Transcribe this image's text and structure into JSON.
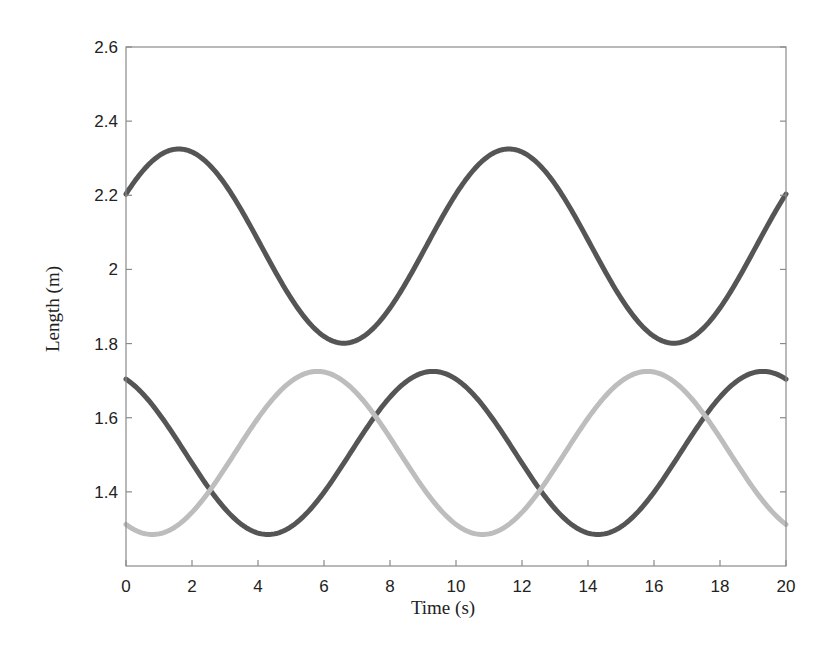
{
  "chart_data": {
    "type": "line",
    "title": "",
    "xlabel": "Time (s)",
    "ylabel": "Length (m)",
    "xlim": [
      0,
      20
    ],
    "ylim": [
      1.2,
      2.6
    ],
    "grid": false,
    "legend": null,
    "xticks": [
      0,
      2,
      4,
      6,
      8,
      10,
      12,
      14,
      16,
      18,
      20
    ],
    "xtick_labels": [
      "0",
      "2",
      "4",
      "6",
      "8",
      "10",
      "12",
      "14",
      "16",
      "18",
      "20"
    ],
    "yticks": [
      1.4,
      1.6,
      1.8,
      2.0,
      2.2,
      2.4,
      2.6
    ],
    "ytick_labels": [
      "1.4",
      "1.6",
      "1.8",
      "2",
      "2.2",
      "2.4",
      "2.6"
    ],
    "x": [
      0,
      1,
      2,
      3,
      4,
      5,
      6,
      7,
      8,
      9,
      10,
      11,
      12,
      13,
      14,
      15,
      16,
      17,
      18,
      19,
      20
    ],
    "series": [
      {
        "name": "upper (dark)",
        "color": "#555555",
        "model": {
          "center": 2.063,
          "amplitude": 0.262,
          "period": 10,
          "phase_peak_t": 1.6
        },
        "values": [
          2.21,
          2.31,
          2.32,
          2.23,
          2.08,
          1.92,
          1.82,
          1.81,
          1.89,
          2.03,
          2.21,
          2.31,
          2.32,
          2.23,
          2.08,
          1.92,
          1.82,
          1.81,
          1.89,
          2.03,
          2.21
        ]
      },
      {
        "name": "lower (dark)",
        "color": "#555555",
        "model": {
          "center": 1.505,
          "amplitude": 0.22,
          "period": 10,
          "phase_peak_t": 9.3
        },
        "values": [
          1.71,
          1.65,
          1.53,
          1.4,
          1.31,
          1.29,
          1.35,
          1.46,
          1.59,
          1.69,
          1.72,
          1.66,
          1.54,
          1.41,
          1.31,
          1.29,
          1.34,
          1.45,
          1.58,
          1.69,
          1.72
        ]
      },
      {
        "name": "lower (light)",
        "color": "#bdbdbd",
        "model": {
          "center": 1.505,
          "amplitude": 0.22,
          "period": 10,
          "phase_peak_t": 5.8
        },
        "values": [
          1.32,
          1.29,
          1.33,
          1.44,
          1.57,
          1.68,
          1.72,
          1.67,
          1.56,
          1.43,
          1.32,
          1.29,
          1.33,
          1.44,
          1.57,
          1.68,
          1.72,
          1.67,
          1.56,
          1.43,
          1.32
        ]
      }
    ]
  }
}
